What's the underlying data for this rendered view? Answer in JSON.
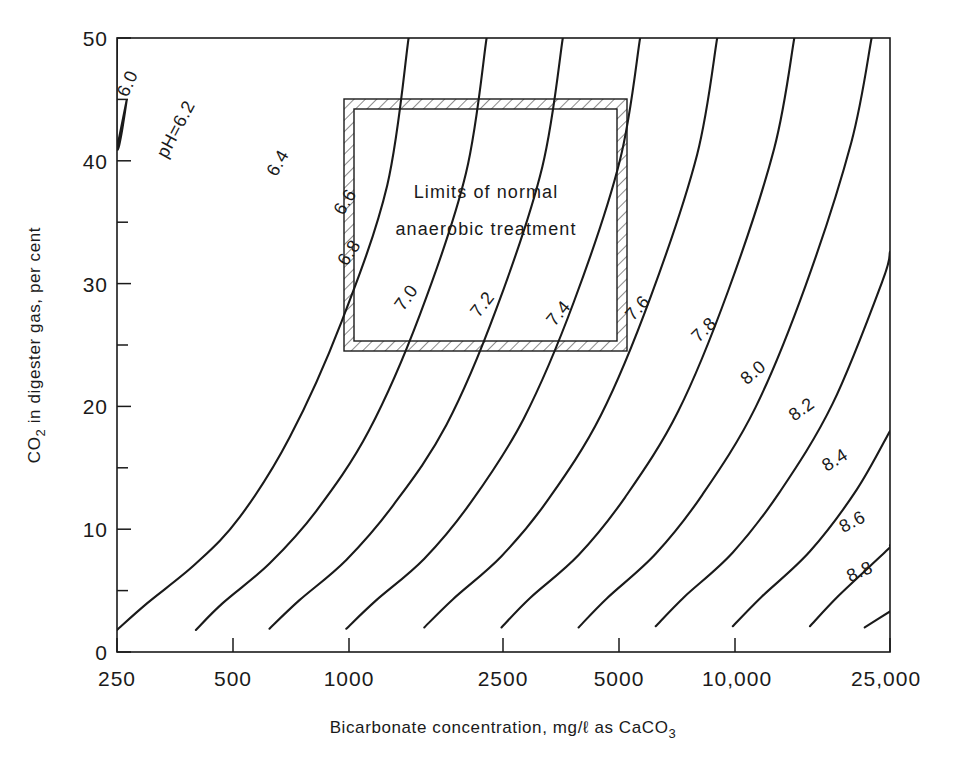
{
  "chart_data": {
    "type": "line",
    "title": "",
    "xlabel": "Bicarbonate concentration, mg/ℓ  as  CaCO3",
    "ylabel": "CO2 in digester gas, per cent",
    "x_scale": "log",
    "xlim": [
      250,
      25000
    ],
    "ylim": [
      0,
      50
    ],
    "grid": false,
    "legend_position": "inline-curve-labels",
    "xticks": [
      250,
      500,
      1000,
      2500,
      5000,
      10000,
      25000
    ],
    "xticklabels": [
      "250",
      "500",
      "1000",
      "2500",
      "5000",
      "10,000",
      "25,000"
    ],
    "yticks": [
      0,
      10,
      20,
      30,
      40,
      50
    ],
    "yticklabels": [
      "0",
      "10",
      "20",
      "30",
      "40",
      "50"
    ],
    "y_minor_ticks": [
      5,
      15,
      25,
      35,
      45
    ],
    "series": [
      {
        "name": "6.0",
        "label": "6.0",
        "points": [
          [
            250,
            50.0
          ],
          [
            250,
            41.0
          ],
          [
            265,
            45.0
          ],
          [
            250,
            41.0
          ]
        ]
      },
      {
        "name": "pH=6.2",
        "label": "pH=6.2",
        "points": [
          [
            250,
            1.8
          ],
          [
            300,
            4.0
          ],
          [
            400,
            7.2
          ],
          [
            520,
            11.0
          ],
          [
            700,
            17.5
          ],
          [
            950,
            26.8
          ],
          [
            1250,
            38.0
          ],
          [
            1420,
            50.0
          ]
        ]
      },
      {
        "name": "6.4",
        "label": "6.4",
        "points": [
          [
            400,
            1.8
          ],
          [
            470,
            4.0
          ],
          [
            620,
            7.2
          ],
          [
            820,
            11.5
          ],
          [
            1120,
            18.0
          ],
          [
            1520,
            27.5
          ],
          [
            2000,
            39.0
          ],
          [
            2260,
            50.0
          ]
        ]
      },
      {
        "name": "6.6",
        "label": "6.6",
        "points": [
          [
            620,
            1.9
          ],
          [
            740,
            4.2
          ],
          [
            980,
            7.5
          ],
          [
            1300,
            12.0
          ],
          [
            1780,
            18.5
          ],
          [
            2400,
            28.0
          ],
          [
            3150,
            39.5
          ],
          [
            3560,
            50.0
          ]
        ]
      },
      {
        "name": "6.8",
        "label": "6.8",
        "points": [
          [
            980,
            1.9
          ],
          [
            1170,
            4.2
          ],
          [
            1560,
            7.6
          ],
          [
            2060,
            12.2
          ],
          [
            2820,
            19.0
          ],
          [
            3800,
            28.5
          ],
          [
            5000,
            40.0
          ],
          [
            5640,
            50.0
          ]
        ]
      },
      {
        "name": "7.0",
        "label": "7.0",
        "points": [
          [
            1560,
            2.0
          ],
          [
            1850,
            4.3
          ],
          [
            2470,
            7.8
          ],
          [
            3260,
            12.4
          ],
          [
            4470,
            19.3
          ],
          [
            6020,
            29.0
          ],
          [
            7920,
            40.5
          ],
          [
            8930,
            50.0
          ]
        ]
      },
      {
        "name": "7.2",
        "label": "7.2",
        "points": [
          [
            2470,
            2.0
          ],
          [
            2930,
            4.4
          ],
          [
            3910,
            7.9
          ],
          [
            5160,
            12.6
          ],
          [
            7080,
            19.6
          ],
          [
            9530,
            29.4
          ],
          [
            12540,
            41.0
          ],
          [
            14140,
            50.0
          ]
        ]
      },
      {
        "name": "7.4",
        "label": "7.4",
        "points": [
          [
            3910,
            2.0
          ],
          [
            4640,
            4.4
          ],
          [
            6190,
            8.0
          ],
          [
            8170,
            12.8
          ],
          [
            11210,
            19.9
          ],
          [
            15100,
            29.8
          ],
          [
            19850,
            41.5
          ],
          [
            22400,
            50.0
          ]
        ]
      },
      {
        "name": "7.6",
        "label": "7.6",
        "points": [
          [
            6190,
            2.1
          ],
          [
            7350,
            4.5
          ],
          [
            9800,
            8.1
          ],
          [
            12940,
            13.0
          ],
          [
            17750,
            20.2
          ],
          [
            23900,
            30.2
          ],
          [
            25000,
            32.6
          ]
        ]
      },
      {
        "name": "7.8",
        "label": "7.8",
        "points": [
          [
            9800,
            2.1
          ],
          [
            11640,
            4.5
          ],
          [
            15520,
            8.2
          ],
          [
            20490,
            13.2
          ],
          [
            25000,
            18.0
          ]
        ]
      },
      {
        "name": "8.0",
        "label": "8.0",
        "points": [
          [
            15520,
            2.1
          ],
          [
            18430,
            4.6
          ],
          [
            24580,
            8.3
          ],
          [
            25000,
            8.7
          ]
        ]
      },
      {
        "name": "8.2",
        "label": "8.2",
        "points": [
          [
            21500,
            2.0
          ],
          [
            25000,
            3.3
          ]
        ]
      },
      {
        "name": "8.4",
        "label": "8.4",
        "points": [
          [
            25000,
            1.7
          ]
        ]
      },
      {
        "name": "8.6",
        "label": "8.6",
        "points": [
          [
            25000,
            1.0
          ]
        ]
      },
      {
        "name": "8.8",
        "label": "8.8",
        "points": [
          [
            25000,
            0.6
          ]
        ]
      }
    ],
    "annotations": [
      {
        "id": "normal-limits-box",
        "text_lines": [
          "Limits of normal",
          "anaerobic treatment"
        ],
        "x_range": [
          1000,
          5200
        ],
        "y_range": [
          25,
          45
        ],
        "style": "hatched-border-rectangle"
      }
    ]
  },
  "curve_labels": [
    {
      "text": "6.0",
      "x": 133,
      "y": 86,
      "rot": -66
    },
    {
      "text": "pH=6.2",
      "x": 181,
      "y": 132,
      "rot": -62
    },
    {
      "text": "6.4",
      "x": 283,
      "y": 166,
      "rot": -60
    },
    {
      "text": "6.6",
      "x": 350,
      "y": 205,
      "rot": -58
    },
    {
      "text": "6.8",
      "x": 354,
      "y": 256,
      "rot": -56
    },
    {
      "text": "7.0",
      "x": 411,
      "y": 301,
      "rot": -54
    },
    {
      "text": "7.2",
      "x": 487,
      "y": 308,
      "rot": -52
    },
    {
      "text": "7.4",
      "x": 563,
      "y": 317,
      "rot": -50
    },
    {
      "text": "7.6",
      "x": 642,
      "y": 312,
      "rot": -48
    },
    {
      "text": "7.8",
      "x": 708,
      "y": 334,
      "rot": -44
    },
    {
      "text": "8.0",
      "x": 757,
      "y": 377,
      "rot": -40
    },
    {
      "text": "8.2",
      "x": 805,
      "y": 414,
      "rot": -36
    },
    {
      "text": "8.4",
      "x": 838,
      "y": 465,
      "rot": -32
    },
    {
      "text": "8.6",
      "x": 855,
      "y": 527,
      "rot": -28
    },
    {
      "text": "8.8",
      "x": 862,
      "y": 577,
      "rot": -24
    }
  ],
  "box_text": {
    "line1": "Limits of normal",
    "line2": "anaerobic treatment"
  },
  "axes": {
    "x_axis_label": "Bicarbonate concentration, mg/ℓ  as  CaCO",
    "x_axis_label_sub": "3",
    "y_axis_label_pre": "CO",
    "y_axis_label_sub": "2",
    "y_axis_label_post": " in digester gas, per cent",
    "x_tick_labels": [
      "250",
      "500",
      "1000",
      "2500",
      "5000",
      "10,000",
      "25,000"
    ],
    "y_tick_labels": [
      "0",
      "10",
      "20",
      "30",
      "40",
      "50"
    ]
  }
}
